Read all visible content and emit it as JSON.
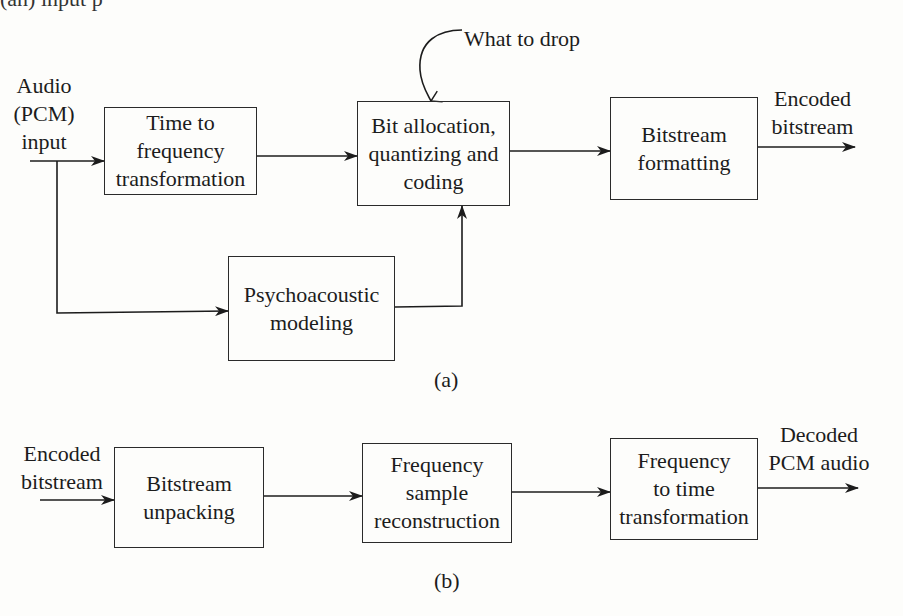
{
  "top_strip": {
    "text": "(an) input p"
  },
  "figure_a": {
    "caption": "(a)",
    "input_label": [
      "Audio",
      "(PCM)",
      "input"
    ],
    "output_label": [
      "Encoded",
      "bitstream"
    ],
    "annotation": "What to drop",
    "blocks": {
      "time_to_freq": [
        "Time to",
        "frequency",
        "transformation"
      ],
      "bit_allocation": [
        "Bit allocation,",
        "quantizing and",
        "coding"
      ],
      "bitstream_formatting": [
        "Bitstream",
        "formatting"
      ],
      "psychoacoustic": [
        "Psychoacoustic",
        "modeling"
      ]
    }
  },
  "figure_b": {
    "caption": "(b)",
    "input_label": [
      "Encoded",
      "bitstream"
    ],
    "output_label": [
      "Decoded",
      "PCM audio"
    ],
    "blocks": {
      "bitstream_unpacking": [
        "Bitstream",
        "unpacking"
      ],
      "freq_sample_reconstruction": [
        "Frequency",
        "sample",
        "reconstruction"
      ],
      "freq_to_time": [
        "Frequency",
        "to time",
        "transformation"
      ]
    }
  }
}
